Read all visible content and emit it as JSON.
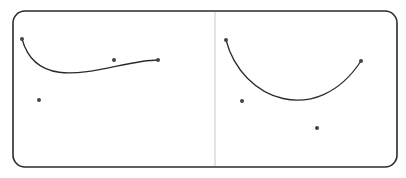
{
  "diagram": {
    "type": "bezier-curves",
    "frame": {
      "x": 13,
      "y": 11,
      "width": 384,
      "height": 156,
      "radius": 12,
      "stroke": "#2b2b2b"
    },
    "divider": {
      "x": 215,
      "y1": 12,
      "y2": 166,
      "stroke": "#c8c8c8"
    },
    "curves": [
      {
        "name": "left-curve",
        "start": [
          22,
          39
        ],
        "control1": [
          39,
          100
        ],
        "control2": [
          114,
          60
        ],
        "end": [
          158,
          60
        ]
      },
      {
        "name": "right-curve",
        "start": [
          226,
          40
        ],
        "control1": [
          242,
          101
        ],
        "control2": [
          317,
          128
        ],
        "end": [
          361,
          61
        ]
      }
    ],
    "curve_color": "#2b2b2b",
    "point_color": "#444444"
  }
}
